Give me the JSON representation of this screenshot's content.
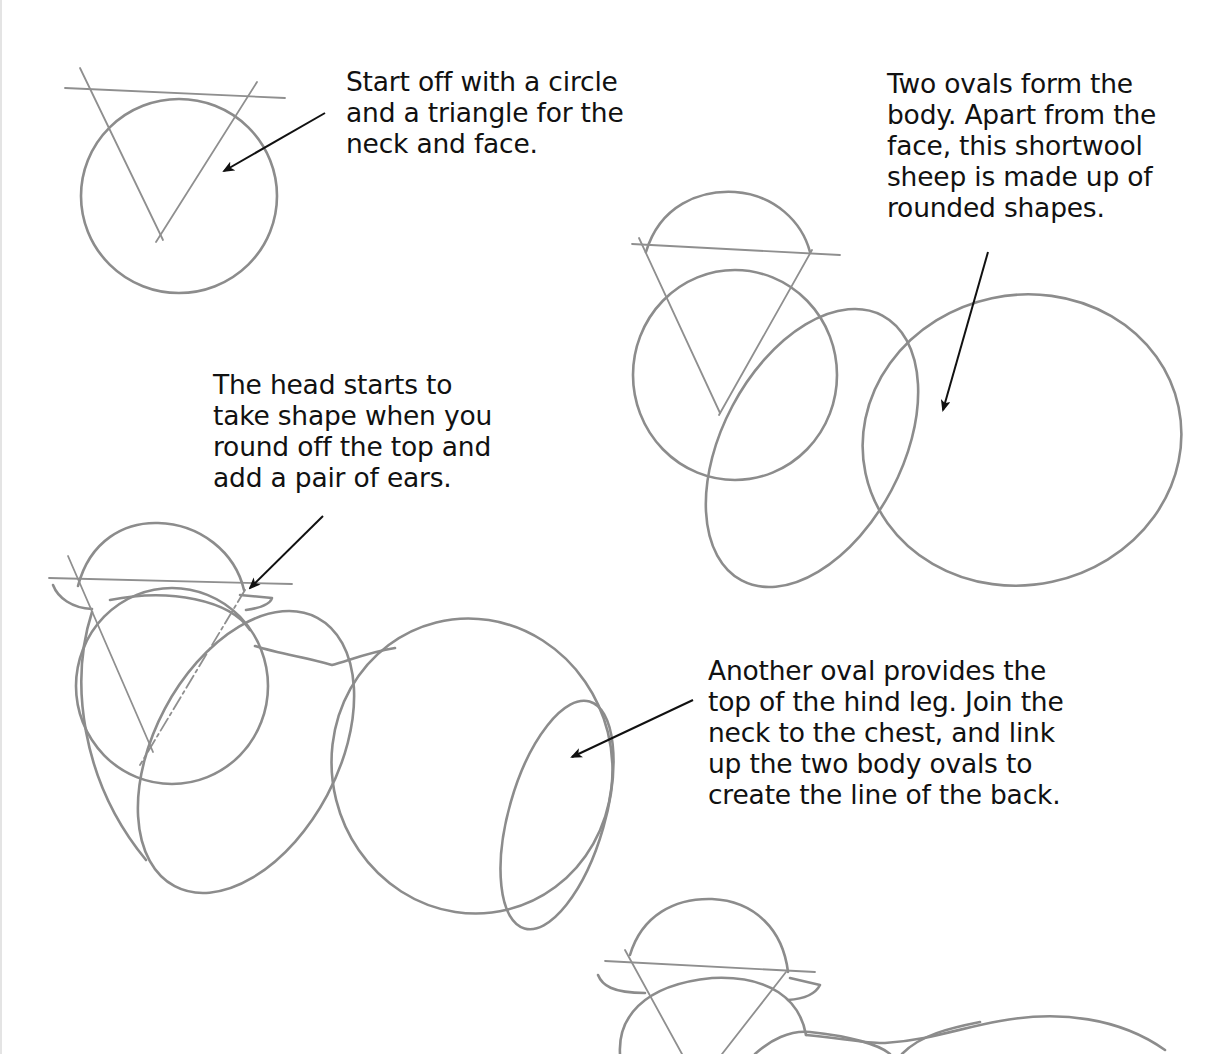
{
  "page": {
    "background": "#ffffff",
    "pencil_color": "#8c8c8c",
    "text_color": "#111111"
  },
  "captions": [
    {
      "id": "step1",
      "lines": [
        "Start off with a circle",
        "and a triangle for the",
        "neck and face."
      ]
    },
    {
      "id": "step2",
      "lines": [
        "Two ovals form the",
        "body. Apart from the",
        "face, this shortwool",
        "sheep is made up of",
        "rounded shapes."
      ]
    },
    {
      "id": "step3",
      "lines": [
        "The head starts to",
        "take shape when you",
        "round off the top and",
        "add a pair of ears."
      ]
    },
    {
      "id": "step4",
      "lines": [
        "Another oval provides the",
        "top of the hind leg. Join the",
        "neck to the chest, and link",
        "up the two body ovals to",
        "create the line of the back."
      ]
    }
  ],
  "sketches": [
    {
      "step": 1,
      "label": "circle and triangle for neck and face"
    },
    {
      "step": 2,
      "label": "head plus two body ovals"
    },
    {
      "step": 3,
      "label": "rounded head with ears, hind leg oval and back line"
    },
    {
      "step": 4,
      "label": "partial next step sketch (cropped)"
    }
  ]
}
